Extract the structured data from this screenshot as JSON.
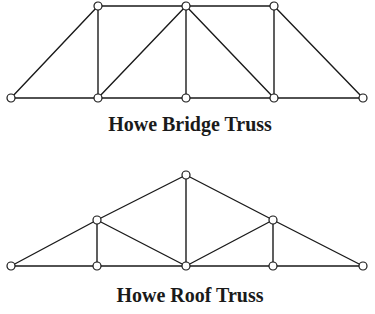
{
  "diagrams": [
    {
      "id": "bridge",
      "caption": "Howe Bridge Truss",
      "caption_pos": [
        190,
        131
      ],
      "nodes": [
        [
          11,
          98
        ],
        [
          98,
          98
        ],
        [
          186,
          98
        ],
        [
          274,
          98
        ],
        [
          363,
          98
        ],
        [
          98,
          6
        ],
        [
          186,
          6
        ],
        [
          274,
          6
        ]
      ],
      "members": [
        [
          0,
          1
        ],
        [
          1,
          2
        ],
        [
          2,
          3
        ],
        [
          3,
          4
        ],
        [
          5,
          6
        ],
        [
          6,
          7
        ],
        [
          0,
          5
        ],
        [
          7,
          4
        ],
        [
          5,
          1
        ],
        [
          6,
          2
        ],
        [
          7,
          3
        ],
        [
          1,
          6
        ],
        [
          6,
          3
        ]
      ]
    },
    {
      "id": "roof",
      "caption": "Howe Roof Truss",
      "caption_pos": [
        190,
        302
      ],
      "nodes": [
        [
          11,
          266
        ],
        [
          97,
          266
        ],
        [
          186,
          266
        ],
        [
          273,
          266
        ],
        [
          363,
          266
        ],
        [
          97,
          220
        ],
        [
          186,
          175
        ],
        [
          273,
          220
        ]
      ],
      "members": [
        [
          0,
          1
        ],
        [
          1,
          2
        ],
        [
          2,
          3
        ],
        [
          3,
          4
        ],
        [
          0,
          5
        ],
        [
          5,
          6
        ],
        [
          6,
          7
        ],
        [
          7,
          4
        ],
        [
          5,
          1
        ],
        [
          6,
          2
        ],
        [
          7,
          3
        ],
        [
          5,
          2
        ],
        [
          2,
          7
        ]
      ]
    }
  ],
  "style": {
    "line_color": "#1a1a1a",
    "node_fill": "#ffffff",
    "node_radius": 4
  }
}
